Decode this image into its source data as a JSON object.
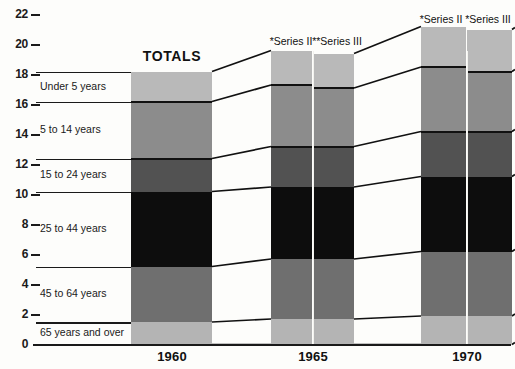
{
  "chart_data": {
    "type": "bar",
    "title": "TOTALS",
    "xlabel": "",
    "ylabel": "",
    "ylim": [
      0,
      22
    ],
    "grid": false,
    "legend_position": "left-inline",
    "stacked": true,
    "categories": [
      "1960",
      "1965 *Series II",
      "1965 **Series III",
      "1970 *Series II",
      "1970 *Series III"
    ],
    "series": [
      {
        "name": "Under 5 years",
        "values": [
          2.0,
          2.3,
          2.1,
          2.8,
          2.6
        ]
      },
      {
        "name": "5 to 14 years",
        "values": [
          3.8,
          4.1,
          4.1,
          4.3,
          4.3
        ]
      },
      {
        "name": "15 to 24 years",
        "values": [
          2.2,
          2.7,
          2.7,
          3.0,
          3.0
        ]
      },
      {
        "name": "25 to 44 years",
        "values": [
          5.0,
          4.8,
          4.8,
          5.0,
          5.0
        ]
      },
      {
        "name": "45 to 64 years",
        "values": [
          3.7,
          4.0,
          4.0,
          4.2,
          4.2
        ]
      },
      {
        "name": "65 years and over",
        "values": [
          1.5,
          1.7,
          1.7,
          1.9,
          1.9
        ]
      }
    ],
    "totals": [
      18.2,
      19.6,
      19.4,
      21.2,
      21.0
    ],
    "yticks": [
      "0",
      "2",
      "4",
      "6",
      "8",
      "10",
      "12",
      "14",
      "16",
      "18",
      "20",
      "22"
    ],
    "colors": {
      "under-5": "#b9b9b9",
      "5-to-14": "#8c8c8c",
      "15-to-24": "#525252",
      "25-to-44": "#0d0d0d",
      "45-to-64": "#6f6f6f",
      "65-and-over": "#b4b4b4",
      "axis": "#1a1a1a",
      "background": "#fdfdfb"
    }
  },
  "axis": {
    "ticks": [
      {
        "label": "22",
        "value": 22
      },
      {
        "label": "20",
        "value": 20
      },
      {
        "label": "18",
        "value": 18
      },
      {
        "label": "16",
        "value": 16
      },
      {
        "label": "14",
        "value": 14
      },
      {
        "label": "12",
        "value": 12
      },
      {
        "label": "10",
        "value": 10
      },
      {
        "label": "8",
        "value": 8
      },
      {
        "label": "6",
        "value": 6
      },
      {
        "label": "4",
        "value": 4
      },
      {
        "label": "2",
        "value": 2
      },
      {
        "label": "0",
        "value": 0
      }
    ]
  },
  "legend": {
    "items": [
      {
        "label": "Under 5 years"
      },
      {
        "label": "5 to 14 years"
      },
      {
        "label": "15 to 24 years"
      },
      {
        "label": "25 to 44 years"
      },
      {
        "label": "45 to 64 years"
      },
      {
        "label": "65 years and over"
      }
    ]
  },
  "groups": [
    {
      "year_label": "1960",
      "headline": "TOTALS",
      "bars": [
        {
          "series_label": ""
        }
      ]
    },
    {
      "year_label": "1965",
      "bars": [
        {
          "series_label": "*Series  II"
        },
        {
          "series_label": "**Series III"
        }
      ]
    },
    {
      "year_label": "1970",
      "bars": [
        {
          "series_label": "*Series  II"
        },
        {
          "series_label": "*Series III"
        }
      ]
    }
  ]
}
